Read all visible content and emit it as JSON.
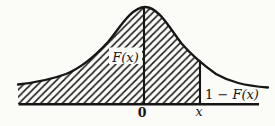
{
  "figure": {
    "colors": {
      "background": "#fbfbf8",
      "ink": "#161616"
    },
    "labels": {
      "shaded_area": "F(x)",
      "right_tail_prefix": "1 − ",
      "right_tail_fx": "F(x)",
      "axis_zero": "0",
      "axis_x": "x"
    }
  }
}
